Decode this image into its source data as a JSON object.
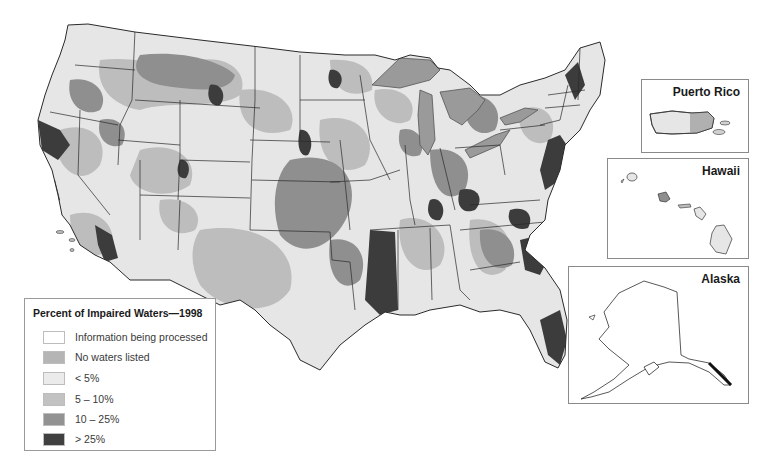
{
  "map": {
    "title": "Percent of Impaired Waters—1998",
    "region": "Contiguous United States",
    "colors": {
      "info_processing": "#ffffff",
      "no_waters": "#b9b9b9",
      "lt5": "#e6e6e6",
      "p5_10": "#bdbdbd",
      "p10_25": "#8f8f8f",
      "gt25": "#3c3c3c",
      "state_border": "#2a2a2a",
      "lakes": "#9a9a9a"
    }
  },
  "legend": {
    "title": "Percent of Impaired Waters—1998",
    "items": [
      {
        "label": "Information being processed",
        "color": "#ffffff"
      },
      {
        "label": "No waters listed",
        "color": "#b5b5b5"
      },
      {
        "label": "< 5%",
        "color": "#ebebeb"
      },
      {
        "label": "5 – 10%",
        "color": "#c2c2c2"
      },
      {
        "label": "10 – 25%",
        "color": "#929292"
      },
      {
        "label": "> 25%",
        "color": "#404040"
      }
    ]
  },
  "insets": {
    "puerto_rico": {
      "title": "Puerto Rico"
    },
    "hawaii": {
      "title": "Hawaii"
    },
    "alaska": {
      "title": "Alaska"
    }
  }
}
